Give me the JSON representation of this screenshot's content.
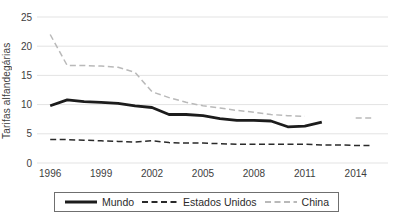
{
  "chart_data": {
    "type": "line",
    "title": "",
    "ylabel": "Tarifas alfandegárias",
    "xlabel": "",
    "ylim": [
      0,
      25
    ],
    "xlim": [
      1995.4,
      2015.9
    ],
    "yticks": [
      0,
      5,
      10,
      15,
      20,
      25
    ],
    "xticks": [
      1996,
      1999,
      2002,
      2005,
      2008,
      2011,
      2014
    ],
    "grid": "horizontal",
    "legend_position": "bottom",
    "series": [
      {
        "name": "Mundo",
        "style": "solid",
        "color": "#1c1c1c",
        "width": 2.8,
        "x": [
          1996,
          1997,
          1998,
          1999,
          2000,
          2001,
          2002,
          2003,
          2004,
          2005,
          2006,
          2007,
          2008,
          2009,
          2010,
          2011,
          2012
        ],
        "values": [
          9.8,
          10.8,
          10.5,
          10.4,
          10.2,
          9.8,
          9.5,
          8.3,
          8.3,
          8.1,
          7.6,
          7.3,
          7.3,
          7.2,
          6.2,
          6.3,
          7.0
        ]
      },
      {
        "name": "Estados Unidos",
        "style": "dashed",
        "color": "#2a2a2a",
        "width": 1.5,
        "x": [
          1996,
          1997,
          1998,
          1999,
          2000,
          2001,
          2002,
          2003,
          2004,
          2005,
          2006,
          2007,
          2008,
          2009,
          2010,
          2011,
          2012,
          2013,
          2014,
          2015
        ],
        "values": [
          4.0,
          4.0,
          3.9,
          3.8,
          3.7,
          3.6,
          3.8,
          3.5,
          3.4,
          3.4,
          3.3,
          3.2,
          3.2,
          3.2,
          3.2,
          3.2,
          3.1,
          3.1,
          3.0,
          3.0
        ]
      },
      {
        "name": "China",
        "style": "dashed",
        "color": "#b9b9b9",
        "width": 1.5,
        "x": [
          1996,
          1997,
          1998,
          1999,
          2000,
          2001,
          2002,
          2003,
          2004,
          2005,
          2006,
          2007,
          2008,
          2009,
          2010,
          2011,
          2012,
          2013,
          2014,
          2015
        ],
        "values": [
          22.0,
          16.7,
          16.7,
          16.6,
          16.4,
          15.5,
          12.2,
          11.2,
          10.4,
          9.8,
          9.4,
          9.0,
          8.7,
          8.3,
          8.1,
          8.0,
          null,
          null,
          7.7,
          7.7
        ]
      }
    ]
  }
}
